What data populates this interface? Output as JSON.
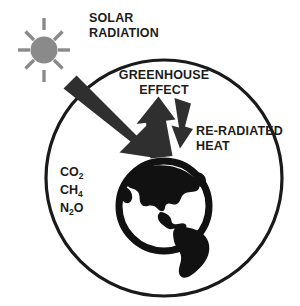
{
  "diagram": {
    "labels": {
      "solar_radiation_line1": "SOLAR",
      "solar_radiation_line2": "RADIATION",
      "greenhouse_effect_line1": "GREENHOUSE",
      "greenhouse_effect_line2": "EFFECT",
      "re_radiated_heat_line1": "RE-RADIATED",
      "re_radiated_heat_line2": "HEAT"
    },
    "greenhouse_gases": [
      {
        "formula": "CO",
        "subscript": "2"
      },
      {
        "formula": "CH",
        "subscript": "4"
      },
      {
        "formula": "N",
        "subscript": "2",
        "suffix": "O"
      }
    ],
    "gas_text": {
      "co2_base": "CO",
      "co2_sub": "2",
      "ch4_base": "CH",
      "ch4_sub": "4",
      "n2o_base": "N",
      "n2o_sub": "2",
      "n2o_tail": "O"
    },
    "colors": {
      "sun": "#8a8a8a",
      "outline": "#1a1a1a",
      "earth": "#111111",
      "arrow": "#2a2a2a",
      "background": "#ffffff",
      "text": "#1c1c1c"
    },
    "elements": {
      "sun_name": "sun",
      "atmosphere_name": "atmosphere-circle",
      "earth_name": "earth-globe",
      "arrow_incoming_name": "solar-radiation-arrow",
      "arrow_up_name": "greenhouse-effect-arrow",
      "arrow_down_name": "re-radiated-heat-arrow"
    }
  }
}
